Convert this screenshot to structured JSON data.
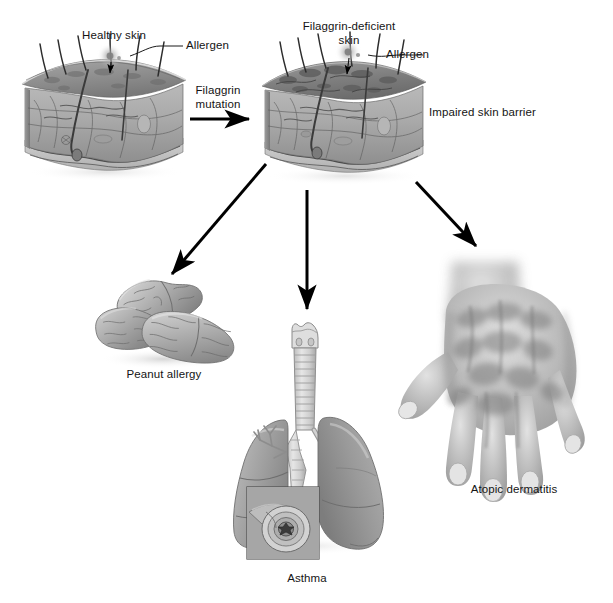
{
  "figure": {
    "type": "medical-illustration-flow-diagram",
    "title_visible": false,
    "background_color": "#ffffff",
    "palette": {
      "ink": "#141414",
      "arrow": "#000000",
      "skin_light": "#c9c9c9",
      "skin_mid": "#a3a3a3",
      "skin_dark": "#7d7d7d",
      "skin_top": "#8e8e8e",
      "peanut_light": "#c2c2c2",
      "peanut_mid": "#9a9a9a",
      "lung_light": "#b5b5b5",
      "lung_mid": "#949494",
      "trachea": "#d6d6d6",
      "hand_light": "#d9d9d9",
      "hand_mid": "#a8a8a8",
      "hand_shadow": "#8c8c8c",
      "inset_bg": "#9e9e9e"
    }
  },
  "labels": {
    "healthy_skin": "Healthy skin",
    "allergen_left": "Allergen",
    "filaggrin_mutation": "Filaggrin\nmutation",
    "filaggrin_deficient_skin": "Filaggrin-deficient\nskin",
    "allergen_right": "Allergen",
    "impaired_skin_barrier": "Impaired skin barrier",
    "peanut_allergy": "Peanut allergy",
    "asthma": "Asthma",
    "atopic_dermatitis": "Atopic dermatitis"
  },
  "nodes": [
    {
      "id": "healthy-skin-block",
      "label": "Healthy skin",
      "kind": "skin-cross-section",
      "x": 22,
      "y": 58,
      "w": 165,
      "h": 115
    },
    {
      "id": "filaggrin-deficient-skin-block",
      "label": "Filaggrin-deficient skin",
      "kind": "skin-cross-section",
      "x": 262,
      "y": 58,
      "w": 165,
      "h": 115
    },
    {
      "id": "peanut-allergy",
      "label": "Peanut allergy",
      "kind": "peanuts",
      "x": 95,
      "y": 285,
      "w": 135,
      "h": 80
    },
    {
      "id": "asthma",
      "label": "Asthma",
      "kind": "lungs",
      "x": 215,
      "y": 315,
      "w": 185,
      "h": 235
    },
    {
      "id": "atopic-dermatitis",
      "label": "Atopic dermatitis",
      "kind": "hand",
      "x": 400,
      "y": 255,
      "w": 200,
      "h": 230
    }
  ],
  "arrows": [
    {
      "id": "arrow-filaggrin-mutation",
      "from": "healthy-skin-block",
      "to": "filaggrin-deficient-skin-block",
      "label": "Filaggrin mutation",
      "direction": "right",
      "x1": 190,
      "y1": 119,
      "x2": 252,
      "y2": 119
    },
    {
      "id": "arrow-to-peanut-allergy",
      "from": "filaggrin-deficient-skin-block",
      "to": "peanut-allergy",
      "label": "",
      "direction": "down-left",
      "x1": 264,
      "y1": 163,
      "x2": 170,
      "y2": 276
    },
    {
      "id": "arrow-to-asthma",
      "from": "filaggrin-deficient-skin-block",
      "to": "asthma",
      "label": "",
      "direction": "down",
      "x1": 307,
      "y1": 190,
      "x2": 307,
      "y2": 311
    },
    {
      "id": "arrow-to-atopic-dermatitis",
      "from": "filaggrin-deficient-skin-block",
      "to": "atopic-dermatitis",
      "label": "",
      "direction": "down-right",
      "x1": 415,
      "y1": 180,
      "x2": 476,
      "y2": 249
    }
  ],
  "callouts": [
    {
      "id": "callout-allergen-left",
      "label": "Allergen",
      "target_node": "healthy-skin-block",
      "x": 148,
      "y": 47
    },
    {
      "id": "callout-allergen-right",
      "label": "Allergen",
      "target_node": "filaggrin-deficient-skin-block",
      "x": 388,
      "y": 56
    }
  ],
  "inset": {
    "id": "bronchiole-inset",
    "parent": "asthma",
    "description_visible": false,
    "x": 247,
    "y": 487,
    "w": 72,
    "h": 72
  }
}
